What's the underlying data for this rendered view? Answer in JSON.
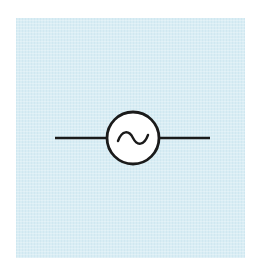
{
  "diagram": {
    "type": "circuit-symbol",
    "symbol": "ac-voltage-source",
    "colors": {
      "page_background": "#ffffff",
      "panel_background": "#d9edf4",
      "stroke": "#1a1a1a",
      "circle_fill": "#ffffff"
    },
    "components": [
      {
        "name": "left-lead-wire",
        "x1": 55,
        "y1": 138,
        "x2": 107,
        "y2": 138
      },
      {
        "name": "source-circle",
        "cx": 133,
        "cy": 138,
        "r": 26
      },
      {
        "name": "sine-wave-glyph",
        "center_x": 133,
        "center_y": 138
      },
      {
        "name": "right-lead-wire",
        "x1": 159,
        "y1": 138,
        "x2": 210,
        "y2": 138
      }
    ]
  }
}
